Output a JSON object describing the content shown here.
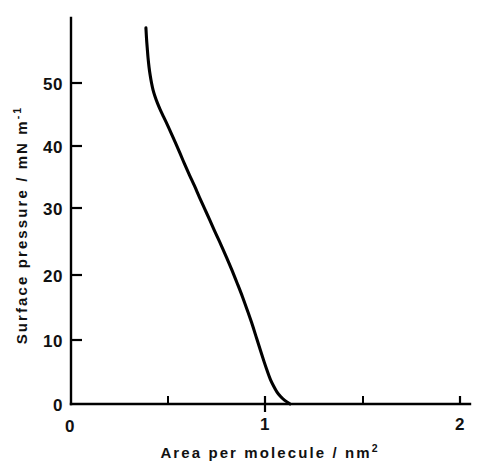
{
  "chart_data": {
    "type": "line",
    "title": "",
    "xlabel": "Area per molecule / nm²",
    "xlabel_base": "Area per molecule / nm",
    "xlabel_exponent": "2",
    "ylabel": "Surface pressure / mN m⁻¹",
    "ylabel_base": "Surface pressure / mN m",
    "ylabel_exponent": "-1",
    "xlim": [
      0,
      2.06
    ],
    "ylim": [
      0,
      60.1
    ],
    "grid": false,
    "legend": null,
    "x_ticks_major": [
      0,
      1,
      2
    ],
    "x_ticklabels": [
      "0",
      "1",
      "2"
    ],
    "x_ticks_minor": [
      0.5,
      1.5
    ],
    "y_ticks_major": [
      0,
      10,
      20,
      30,
      40,
      50
    ],
    "y_ticklabels": [
      "0",
      "10",
      "20",
      "30",
      "40",
      "50"
    ],
    "y_ticks_minor": [],
    "series": [
      {
        "name": "isotherm",
        "color": "#000000",
        "x": [
          0.381,
          0.384,
          0.388,
          0.392,
          0.397,
          0.403,
          0.41,
          0.418,
          0.428,
          0.44,
          0.454,
          0.471,
          0.49,
          0.511,
          0.533,
          0.556,
          0.58,
          0.605,
          0.631,
          0.657,
          0.684,
          0.711,
          0.739,
          0.768,
          0.797,
          0.825,
          0.853,
          0.88,
          0.906,
          0.93,
          0.952,
          0.972,
          0.99,
          1.007,
          1.023,
          1.039,
          1.056,
          1.074,
          1.095,
          1.124
        ],
        "y": [
          58.6,
          57.0,
          55.4,
          53.9,
          52.5,
          51.2,
          50.0,
          48.9,
          47.9,
          46.9,
          45.9,
          44.8,
          43.6,
          42.2,
          40.7,
          39.1,
          37.4,
          35.7,
          34.0,
          32.2,
          30.4,
          28.6,
          26.7,
          24.8,
          22.8,
          20.8,
          18.7,
          16.6,
          14.4,
          12.3,
          10.2,
          8.3,
          6.6,
          5.1,
          3.8,
          2.8,
          1.9,
          1.2,
          0.6,
          0.0
        ]
      }
    ],
    "annotations": []
  },
  "axis_geometry": {
    "x0_px": 72,
    "x_per_unit_px": 194,
    "y0_px": 404,
    "y_per_unit_px": 6.42,
    "y_axis_top_px": 18,
    "x_axis_right_px": 470
  }
}
